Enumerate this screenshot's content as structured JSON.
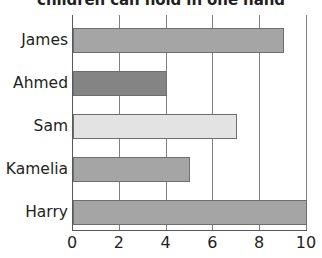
{
  "chart_data": {
    "type": "bar",
    "orientation": "horizontal",
    "title": "children can hold in one hand",
    "xlabel": "",
    "ylabel": "",
    "categories": [
      "James",
      "Ahmed",
      "Sam",
      "Kamelia",
      "Harry"
    ],
    "values": [
      9,
      4,
      7,
      5,
      10
    ],
    "bar_colors": [
      "#a5a5a5",
      "#848484",
      "#e3e3e3",
      "#a5a5a5",
      "#a5a5a5"
    ],
    "bar_edge_color": "#6e6e6e",
    "xlim": [
      0,
      10
    ],
    "xticks": [
      0,
      2,
      4,
      6,
      8,
      10
    ],
    "xtick_labels": [
      "0",
      "2",
      "4",
      "6",
      "8",
      "10"
    ],
    "grid": true,
    "grid_axis": "x",
    "grid_color": "#808080",
    "axis_color": "#58595b",
    "legend": null,
    "text_color": "#231f20",
    "background": "#ffffff"
  }
}
